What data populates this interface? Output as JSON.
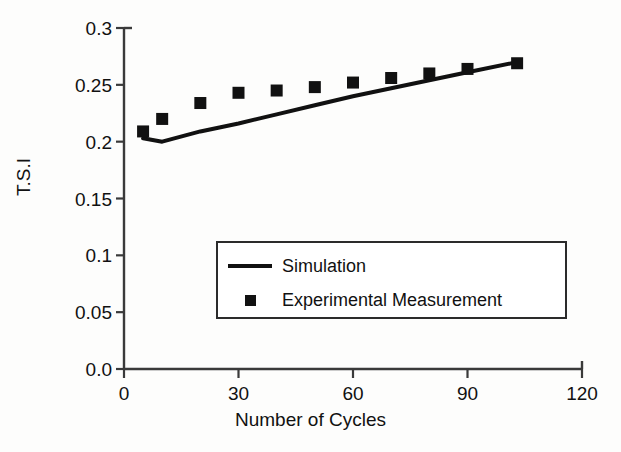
{
  "chart_data": {
    "type": "line",
    "title": "",
    "xlabel": "Number of Cycles",
    "ylabel": "T.S.I",
    "xlim": [
      0,
      120
    ],
    "ylim": [
      0.0,
      0.3
    ],
    "grid": false,
    "legend_position": "center",
    "xticks": [
      "0",
      "30",
      "60",
      "90",
      "120"
    ],
    "xtick_values": [
      0,
      30,
      60,
      90,
      120
    ],
    "yticks": [
      "0.0",
      "0.05",
      "0.1",
      "0.15",
      "0.2",
      "0.25",
      "0.3"
    ],
    "ytick_values": [
      0.0,
      0.05,
      0.1,
      0.15,
      0.2,
      0.25,
      0.3
    ],
    "series": [
      {
        "name": "Simulation",
        "style": "line",
        "color": "#111111",
        "x": [
          5,
          10,
          20,
          30,
          40,
          50,
          60,
          70,
          80,
          90,
          103
        ],
        "values": [
          0.203,
          0.2,
          0.209,
          0.216,
          0.224,
          0.232,
          0.24,
          0.247,
          0.254,
          0.261,
          0.27
        ]
      },
      {
        "name": "Experimental Measurement",
        "style": "marker",
        "marker": "square",
        "color": "#111111",
        "x": [
          5,
          10,
          20,
          30,
          40,
          50,
          60,
          70,
          80,
          90,
          103
        ],
        "values": [
          0.209,
          0.22,
          0.234,
          0.243,
          0.245,
          0.248,
          0.252,
          0.256,
          0.26,
          0.264,
          0.269
        ]
      }
    ]
  },
  "legend": {
    "entries": [
      {
        "label": "Simulation",
        "swatch": "line-swatch"
      },
      {
        "label": "Experimental Measurement",
        "swatch": "square-swatch"
      }
    ]
  },
  "colors": {
    "ink": "#111111",
    "axis": "#3a3a3a",
    "background": "#fdfdfc"
  }
}
